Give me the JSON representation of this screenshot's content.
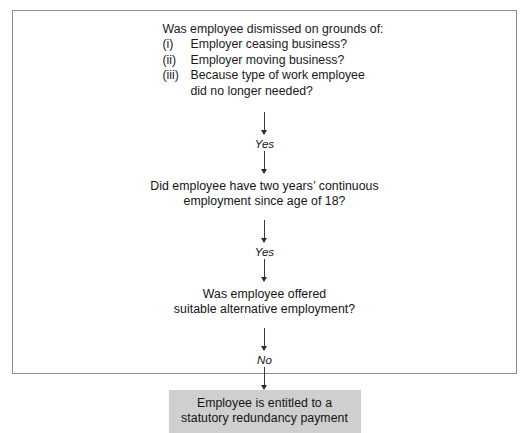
{
  "diagram": {
    "border_color": "#8d8d8d",
    "accent_box_color": "#cfcfcf",
    "text_color": "#141414",
    "question_1": {
      "lead": "Was employee dismissed on grounds of:",
      "items": [
        {
          "marker": "(i)",
          "text": "Employer ceasing business?"
        },
        {
          "marker": "(ii)",
          "text": "Employer moving business?"
        },
        {
          "marker": "(iii)",
          "text": "Because type of work employee",
          "continuation": "did no longer needed?"
        }
      ]
    },
    "connector_1": {
      "label": "Yes"
    },
    "question_2": {
      "line_1": "Did employee have two years’ continuous",
      "line_2": "employment since age of 18?"
    },
    "connector_2": {
      "label": "Yes"
    },
    "question_3": {
      "line_1": "Was employee offered",
      "line_2": "suitable alternative employment?"
    },
    "connector_3": {
      "label": "No"
    },
    "result": {
      "line_1": "Employee is entitled to a",
      "line_2": "statutory redundancy payment"
    }
  }
}
